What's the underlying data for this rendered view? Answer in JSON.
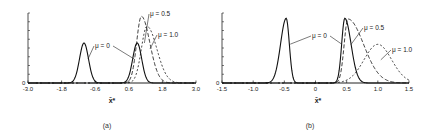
{
  "chart_data": [
    {
      "type": "line",
      "panel_caption": "(a)",
      "xlabel": "x̄*",
      "ylabel": "",
      "y_zero_label": "0",
      "xlim": [
        -3.0,
        3.0
      ],
      "ylim": [
        0,
        1.05
      ],
      "xticks": [
        -3.0,
        -1.8,
        -0.6,
        0.6,
        1.8,
        3.0
      ],
      "xtick_labels": [
        "-3.0",
        "-1.8",
        "-0.6",
        "0.6",
        "1.8",
        "3.0"
      ],
      "grid": false,
      "series": [
        {
          "name": "μ=0",
          "label": "μ = 0",
          "style": "solid",
          "components": [
            {
              "mean": -1.0,
              "sd": 0.16,
              "peak": 0.6
            },
            {
              "mean": 0.9,
              "sd": 0.16,
              "peak": 0.6
            }
          ]
        },
        {
          "name": "μ=0.5",
          "label": "μ = 0.5",
          "style": "dashed",
          "components": [
            {
              "mean": 1.05,
              "sd": 0.17,
              "sd_right": 0.3,
              "peak": 1.0
            }
          ]
        },
        {
          "name": "μ=1.0",
          "label": "μ = 1.0",
          "style": "dotted",
          "components": [
            {
              "mean": 1.25,
              "sd": 0.2,
              "sd_right": 0.35,
              "peak": 0.85
            }
          ]
        }
      ],
      "annotations": [
        {
          "text": "μ = 0",
          "points_to": [
            -1.0,
            0.9
          ]
        },
        {
          "text": "μ = 0.5",
          "points_to": [
            1.05
          ]
        },
        {
          "text": "μ = 1.0",
          "points_to": [
            1.25
          ]
        }
      ]
    },
    {
      "type": "line",
      "panel_caption": "(b)",
      "xlabel": "x̄*",
      "ylabel": "",
      "y_zero_label": "0",
      "xlim": [
        -1.5,
        1.5
      ],
      "ylim": [
        0,
        1.05
      ],
      "xticks": [
        -1.5,
        -1.0,
        -0.5,
        0,
        0.5,
        1.0,
        1.5
      ],
      "xtick_labels": [
        "-1.5",
        "-1.0",
        "-0.5",
        "0",
        "0.5",
        "1.0",
        "1.5"
      ],
      "grid": false,
      "series": [
        {
          "name": "μ=0",
          "label": "μ = 0",
          "style": "solid",
          "components": [
            {
              "mean": -0.47,
              "sd": 0.09,
              "sd_right": 0.05,
              "peak": 0.97
            },
            {
              "mean": 0.47,
              "sd": 0.05,
              "sd_right": 0.1,
              "peak": 0.97
            }
          ]
        },
        {
          "name": "μ=0.5",
          "label": "μ = 0.5",
          "style": "dashed",
          "components": [
            {
              "mean": 0.52,
              "sd": 0.06,
              "sd_right": 0.25,
              "peak": 0.96
            }
          ]
        },
        {
          "name": "μ=1.0",
          "label": "μ = 1.0",
          "style": "dotted",
          "components": [
            {
              "mean": 1.0,
              "sd": 0.22,
              "sd_right": 0.22,
              "peak": 0.58
            }
          ]
        }
      ],
      "annotations": [
        {
          "text": "μ = 0",
          "points_to": [
            -0.47,
            0.47
          ]
        },
        {
          "text": "μ = 0.5",
          "points_to": [
            0.52
          ]
        },
        {
          "text": "μ = 1.0",
          "points_to": [
            1.0
          ]
        }
      ]
    }
  ]
}
